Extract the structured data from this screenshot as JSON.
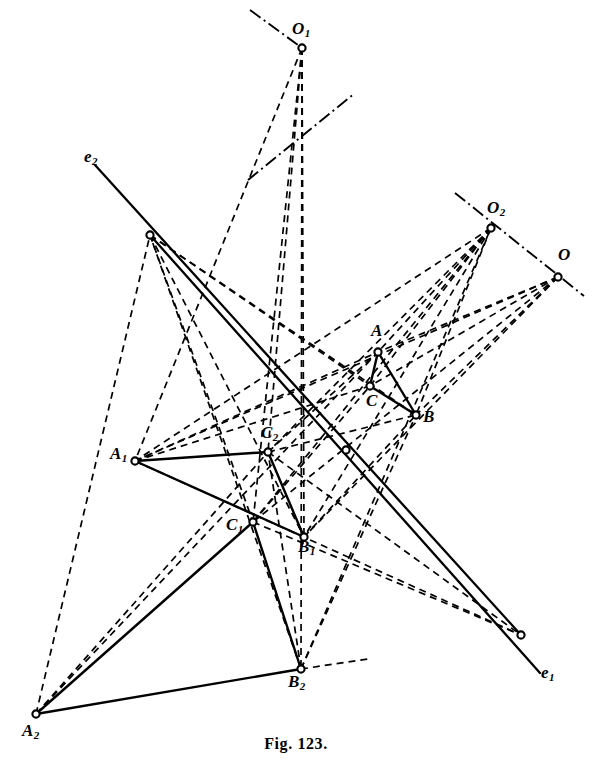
{
  "figure": {
    "caption": "Fig. 123.",
    "stroke_color": "#000000",
    "background_color": "#ffffff",
    "width": 592,
    "height": 769
  },
  "chart_data": {
    "type": "diagram",
    "title": "Fig. 123.",
    "xlabel": "",
    "ylabel": "",
    "points": [
      {
        "id": "O1",
        "label": "O",
        "sub": "1",
        "x": 302,
        "y": 48,
        "label_x": 292,
        "label_y": 20,
        "node": true
      },
      {
        "id": "O2",
        "label": "O",
        "sub": "2",
        "x": 491,
        "y": 228,
        "label_x": 487,
        "label_y": 199,
        "node": true
      },
      {
        "id": "O",
        "label": "O",
        "sub": "",
        "x": 558,
        "y": 277,
        "label_x": 558,
        "label_y": 246,
        "node": true
      },
      {
        "id": "A",
        "label": "A",
        "sub": "",
        "x": 378,
        "y": 352,
        "label_x": 371,
        "label_y": 322,
        "node": true
      },
      {
        "id": "C",
        "label": "C",
        "sub": "",
        "x": 370,
        "y": 386,
        "label_x": 366,
        "label_y": 392,
        "node": true
      },
      {
        "id": "B",
        "label": "B",
        "sub": "",
        "x": 416,
        "y": 415,
        "label_x": 423,
        "label_y": 408,
        "node": true
      },
      {
        "id": "A1",
        "label": "A",
        "sub": "1",
        "x": 135,
        "y": 461,
        "label_x": 110,
        "label_y": 445,
        "node": true
      },
      {
        "id": "C2",
        "label": "C",
        "sub": "2",
        "x": 268,
        "y": 452,
        "label_x": 261,
        "label_y": 424,
        "node": true
      },
      {
        "id": "C1",
        "label": "C",
        "sub": "1",
        "x": 253,
        "y": 522,
        "label_x": 226,
        "label_y": 516,
        "node": true
      },
      {
        "id": "B1",
        "label": "B",
        "sub": "1",
        "x": 304,
        "y": 537,
        "label_x": 298,
        "label_y": 538,
        "node": true
      },
      {
        "id": "A2",
        "label": "A",
        "sub": "2",
        "x": 36,
        "y": 714,
        "label_x": 22,
        "label_y": 722,
        "node": true
      },
      {
        "id": "B2",
        "label": "B",
        "sub": "2",
        "x": 301,
        "y": 669,
        "label_x": 288,
        "label_y": 673,
        "node": true
      },
      {
        "id": "E2",
        "label": "e",
        "sub": "2",
        "x": 95,
        "y": 165,
        "label_x": 84,
        "label_y": 148,
        "node": false
      },
      {
        "id": "E1",
        "label": "e",
        "sub": "1",
        "x": 540,
        "y": 673,
        "label_x": 541,
        "label_y": 664,
        "node": false
      },
      {
        "id": "P1",
        "label": "",
        "sub": "",
        "x": 150,
        "y": 235,
        "label_x": 0,
        "label_y": 0,
        "node": true
      },
      {
        "id": "P2",
        "label": "",
        "sub": "",
        "x": 346,
        "y": 450,
        "label_x": 0,
        "label_y": 0,
        "node": true
      },
      {
        "id": "P3",
        "label": "",
        "sub": "",
        "x": 521,
        "y": 635,
        "label_x": 0,
        "label_y": 0,
        "node": true
      }
    ],
    "solid_segments": [
      {
        "from": "A",
        "to": "C"
      },
      {
        "from": "C",
        "to": "B"
      },
      {
        "from": "A",
        "to": "B"
      },
      {
        "from": "A1",
        "to": "C2"
      },
      {
        "from": "C2",
        "to": "B1"
      },
      {
        "from": "A1",
        "to": "B1"
      },
      {
        "from": "A2",
        "to": "C1"
      },
      {
        "from": "C1",
        "to": "B2"
      },
      {
        "from": "A2",
        "to": "B2"
      }
    ],
    "solid_lines": [
      {
        "name": "axis-e2",
        "x1": 95,
        "y1": 165,
        "x2": 521,
        "y2": 635
      },
      {
        "name": "axis-e1",
        "x1": 150,
        "y1": 235,
        "x2": 540,
        "y2": 673
      }
    ],
    "dashed_rays": [
      {
        "name": "O1-to-A1",
        "x1": 302,
        "y1": 48,
        "x2": 135,
        "y2": 461
      },
      {
        "name": "O1-to-C2",
        "x1": 302,
        "y1": 48,
        "x2": 268,
        "y2": 452
      },
      {
        "name": "O1-to-C1",
        "x1": 302,
        "y1": 48,
        "x2": 253,
        "y2": 522
      },
      {
        "name": "O1-to-B1",
        "x1": 302,
        "y1": 48,
        "x2": 304,
        "y2": 537
      },
      {
        "name": "O1-to-B2",
        "x1": 302,
        "y1": 48,
        "x2": 301,
        "y2": 669
      },
      {
        "name": "O2-to-A1",
        "x1": 491,
        "y1": 228,
        "x2": 135,
        "y2": 461
      },
      {
        "name": "O2-to-C2",
        "x1": 491,
        "y1": 228,
        "x2": 268,
        "y2": 452
      },
      {
        "name": "O2-to-C1",
        "x1": 491,
        "y1": 228,
        "x2": 253,
        "y2": 522
      },
      {
        "name": "O2-to-B1",
        "x1": 491,
        "y1": 228,
        "x2": 304,
        "y2": 537
      },
      {
        "name": "O2-to-A",
        "x1": 491,
        "y1": 228,
        "x2": 378,
        "y2": 352
      },
      {
        "name": "O2-to-C",
        "x1": 491,
        "y1": 228,
        "x2": 370,
        "y2": 386
      },
      {
        "name": "O2-to-B",
        "x1": 491,
        "y1": 228,
        "x2": 416,
        "y2": 415
      },
      {
        "name": "O-to-A",
        "x1": 558,
        "y1": 277,
        "x2": 378,
        "y2": 352
      },
      {
        "name": "O-to-C",
        "x1": 558,
        "y1": 277,
        "x2": 370,
        "y2": 386
      },
      {
        "name": "O-to-B",
        "x1": 558,
        "y1": 277,
        "x2": 416,
        "y2": 415
      },
      {
        "name": "O-to-A1",
        "x1": 558,
        "y1": 277,
        "x2": 135,
        "y2": 461
      },
      {
        "name": "O-to-C1",
        "x1": 558,
        "y1": 277,
        "x2": 253,
        "y2": 522
      },
      {
        "name": "O-to-B1",
        "x1": 558,
        "y1": 277,
        "x2": 304,
        "y2": 537
      },
      {
        "name": "A2-to-A",
        "x1": 36,
        "y1": 714,
        "x2": 378,
        "y2": 352
      },
      {
        "name": "A2-to-C2",
        "x1": 36,
        "y1": 714,
        "x2": 268,
        "y2": 452
      },
      {
        "name": "A2-to-P1",
        "x1": 36,
        "y1": 714,
        "x2": 150,
        "y2": 235
      },
      {
        "name": "B2-to-P1",
        "x1": 301,
        "y1": 669,
        "x2": 150,
        "y2": 235
      },
      {
        "name": "B2-to-B",
        "x1": 301,
        "y1": 669,
        "x2": 416,
        "y2": 415
      },
      {
        "name": "B2-to-O2",
        "x1": 301,
        "y1": 669,
        "x2": 491,
        "y2": 228
      },
      {
        "name": "C1-to-P3",
        "x1": 253,
        "y1": 522,
        "x2": 521,
        "y2": 635
      },
      {
        "name": "A1-to-P3",
        "x1": 135,
        "y1": 461,
        "x2": 521,
        "y2": 635
      },
      {
        "name": "C2-to-P3",
        "x1": 268,
        "y1": 452,
        "x2": 521,
        "y2": 635
      },
      {
        "name": "P1-to-B",
        "x1": 150,
        "y1": 235,
        "x2": 416,
        "y2": 415
      },
      {
        "name": "P1-to-C",
        "x1": 150,
        "y1": 235,
        "x2": 370,
        "y2": 386
      },
      {
        "name": "P1-to-B1",
        "x1": 150,
        "y1": 235,
        "x2": 304,
        "y2": 537
      },
      {
        "name": "P1-to-C1",
        "x1": 150,
        "y1": 235,
        "x2": 253,
        "y2": 522
      },
      {
        "name": "A1-to-A",
        "x1": 135,
        "y1": 461,
        "x2": 378,
        "y2": 352
      },
      {
        "name": "A1-to-C",
        "x1": 135,
        "y1": 461,
        "x2": 370,
        "y2": 386
      },
      {
        "name": "C1-to-C",
        "x1": 253,
        "y1": 522,
        "x2": 370,
        "y2": 386
      },
      {
        "name": "B1-to-B",
        "x1": 304,
        "y1": 537,
        "x2": 416,
        "y2": 415
      },
      {
        "name": "C2-to-B",
        "x1": 268,
        "y1": 452,
        "x2": 416,
        "y2": 415
      },
      {
        "name": "C2-to-A",
        "x1": 268,
        "y1": 452,
        "x2": 378,
        "y2": 352
      },
      {
        "name": "B2-to-C2",
        "x1": 301,
        "y1": 669,
        "x2": 268,
        "y2": 452
      },
      {
        "name": "B2-to-right",
        "x1": 301,
        "y1": 669,
        "x2": 368,
        "y2": 659
      }
    ],
    "dashdot_lines": [
      {
        "name": "axis-through-O1",
        "x1": 248,
        "y1": 180,
        "x2": 355,
        "y2": 93
      },
      {
        "name": "axis-through-O1-upper",
        "x1": 250,
        "y1": 10,
        "x2": 302,
        "y2": 48
      },
      {
        "name": "axis-through-O2-O",
        "x1": 455,
        "y1": 193,
        "x2": 584,
        "y2": 296
      }
    ],
    "axis_labels": [
      "e1",
      "e2"
    ],
    "centres": [
      "O",
      "O1",
      "O2"
    ],
    "triangles": [
      {
        "name": "ABC",
        "vertices": [
          "A",
          "B",
          "C"
        ]
      },
      {
        "name": "A1B1C1",
        "vertices": [
          "A1",
          "B1",
          "C2"
        ]
      },
      {
        "name": "A2B2C2",
        "vertices": [
          "A2",
          "B2",
          "C1"
        ]
      }
    ]
  }
}
